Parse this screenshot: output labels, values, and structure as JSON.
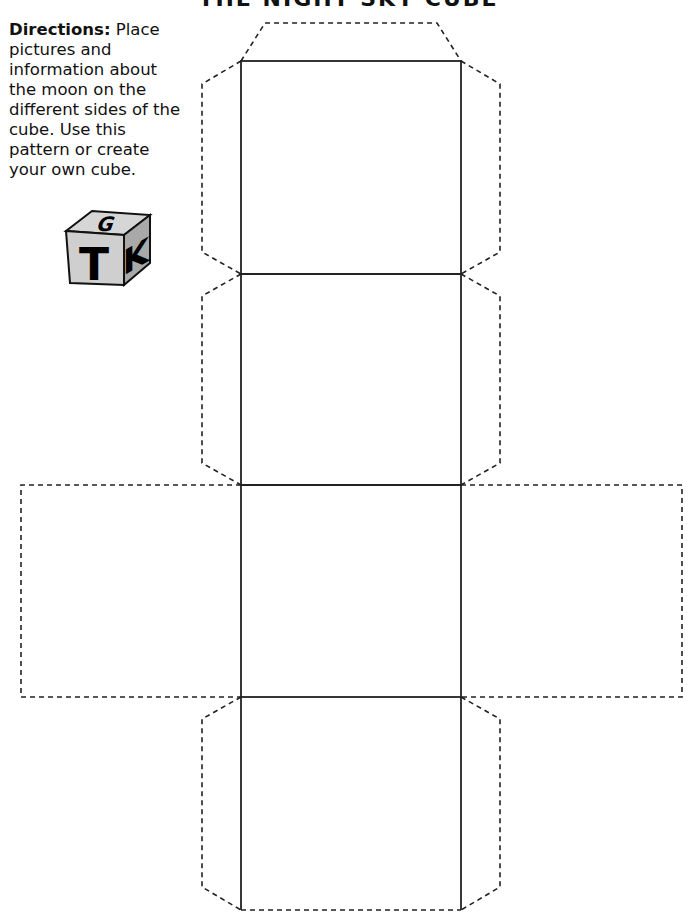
{
  "page": {
    "title": "THE NIGHT SKY CUBE"
  },
  "directions": {
    "label": "Directions:",
    "text": " Place pictures and information about the moon on the different sides of the cube. Use this pattern or create your own cube."
  },
  "logo": {
    "icon": "gtk-cube-icon",
    "letters": {
      "top": "G",
      "front": "T",
      "side": "K"
    }
  },
  "cube_net": {
    "faces": 6,
    "solid_faces": 4,
    "dashed_faces": 2,
    "tabs": 7,
    "line_color": "#222222",
    "dash_color": "#222222"
  }
}
